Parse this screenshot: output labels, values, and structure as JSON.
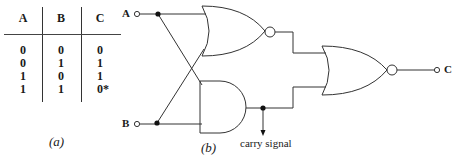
{
  "truth_table": {
    "headers": [
      "A",
      "B",
      "C"
    ],
    "rows": [
      [
        "0",
        "0",
        "0"
      ],
      [
        "0",
        "1",
        "1"
      ],
      [
        "1",
        "0",
        "1"
      ],
      [
        "1",
        "1",
        "0*"
      ]
    ],
    "caption": "(a)"
  },
  "circuit": {
    "inputs": {
      "a": "A",
      "b": "B"
    },
    "output": "C",
    "carry_label": "carry signal",
    "caption": "(b)",
    "gates": [
      "NOR (A, B)",
      "AND (A, B)",
      "NOR (NOR output, AND output)"
    ]
  }
}
